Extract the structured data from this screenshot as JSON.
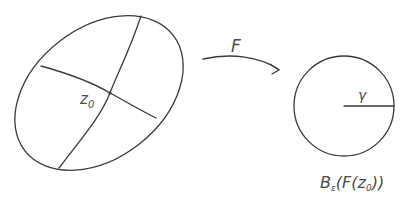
{
  "diagram": {
    "type": "mapping-illustration",
    "left_shape": {
      "kind": "ellipse",
      "center_label": "z",
      "center_label_sub": "0",
      "axes": 2
    },
    "map": {
      "label": "F",
      "kind": "curved-arrow"
    },
    "right_shape": {
      "kind": "circle",
      "radius_label": "γ",
      "caption_B": "B",
      "caption_sub": "ε",
      "caption_rest_1": "(F(z",
      "caption_sub2": "0",
      "caption_rest_2": "))"
    },
    "colors": {
      "stroke": "#3a3a3a",
      "text": "#4a4a4a",
      "background": "#ffffff"
    }
  }
}
